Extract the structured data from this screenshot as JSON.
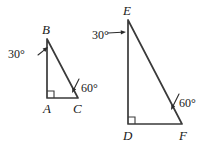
{
  "figure": {
    "background_color": "#ffffff",
    "line_color": "#3a3a3a",
    "text_color": "#1a1a1a"
  },
  "triangles": [
    {
      "id": "triangle-abc",
      "name": "triangle ABC",
      "vertices": [
        {
          "label": "B",
          "name": "vertex-b",
          "x": 47,
          "y": 39,
          "label_x": 42,
          "label_y": 34
        },
        {
          "label": "A",
          "name": "vertex-a",
          "x": 47,
          "y": 98,
          "label_x": 43,
          "label_y": 113
        },
        {
          "label": "C",
          "name": "vertex-c",
          "x": 78,
          "y": 98,
          "label_x": 73,
          "label_y": 113
        }
      ],
      "right_angle_at": "A",
      "angles": [
        {
          "value": "30°",
          "name": "angle-label-b-30",
          "at_vertex": "B",
          "text_x": 8,
          "text_y": 58,
          "pointer": {
            "x1": 38,
            "y1": 55,
            "x2": 48,
            "y2": 47
          }
        },
        {
          "value": "60°",
          "name": "angle-label-c-60",
          "at_vertex": "C",
          "text_x": 81,
          "text_y": 92,
          "pointer": {
            "x1": 79,
            "y1": 79,
            "x2": 72,
            "y2": 93
          }
        }
      ]
    },
    {
      "id": "triangle-def",
      "name": "triangle DEF",
      "vertices": [
        {
          "label": "E",
          "name": "vertex-e",
          "x": 128,
          "y": 20,
          "label_x": 123,
          "label_y": 15
        },
        {
          "label": "D",
          "name": "vertex-d",
          "x": 128,
          "y": 124,
          "label_x": 123,
          "label_y": 140
        },
        {
          "label": "F",
          "name": "vertex-f",
          "x": 182,
          "y": 124,
          "label_x": 179,
          "label_y": 140
        }
      ],
      "right_angle_at": "D",
      "angles": [
        {
          "value": "30°",
          "name": "angle-label-e-30",
          "at_vertex": "E",
          "text_x": 92,
          "text_y": 39,
          "pointer": {
            "x1": 108,
            "y1": 33,
            "x2": 126,
            "y2": 32
          }
        },
        {
          "value": "60°",
          "name": "angle-label-f-60",
          "at_vertex": "F",
          "text_x": 179,
          "text_y": 107,
          "pointer": {
            "x1": 179,
            "y1": 94,
            "x2": 171,
            "y2": 110
          }
        }
      ]
    }
  ]
}
